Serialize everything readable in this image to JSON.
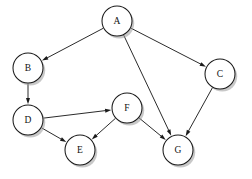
{
  "graph": {
    "title": "Directed Acyclic Graph",
    "background_color": "#ffffff",
    "node_fill": "#ffffff",
    "node_stroke": "#1a1a1a",
    "edge_color": "#2b2b2b",
    "label_color": "#111111",
    "shadow_color": "#9a9a9a",
    "node_radius": 15,
    "nodes": [
      {
        "id": "A",
        "label": "A",
        "cx": 117,
        "cy": 21
      },
      {
        "id": "B",
        "label": "B",
        "cx": 28,
        "cy": 68
      },
      {
        "id": "C",
        "label": "C",
        "cx": 220,
        "cy": 74
      },
      {
        "id": "D",
        "label": "D",
        "cx": 28,
        "cy": 120
      },
      {
        "id": "E",
        "label": "E",
        "cx": 80,
        "cy": 150
      },
      {
        "id": "F",
        "label": "F",
        "cx": 127,
        "cy": 108
      },
      {
        "id": "G",
        "label": "G",
        "cx": 178,
        "cy": 150
      }
    ],
    "edges": [
      {
        "from": "A",
        "to": "B",
        "directed": true
      },
      {
        "from": "A",
        "to": "C",
        "directed": true
      },
      {
        "from": "A",
        "to": "G",
        "directed": true
      },
      {
        "from": "B",
        "to": "D",
        "directed": true
      },
      {
        "from": "D",
        "to": "F",
        "directed": true
      },
      {
        "from": "D",
        "to": "E",
        "directed": true
      },
      {
        "from": "F",
        "to": "E",
        "directed": true
      },
      {
        "from": "F",
        "to": "G",
        "directed": true
      },
      {
        "from": "C",
        "to": "G",
        "directed": true
      }
    ]
  }
}
